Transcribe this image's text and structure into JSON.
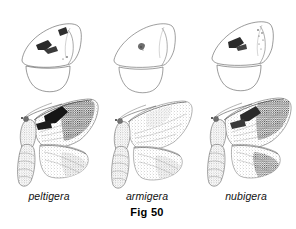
{
  "plate": {
    "figure_number": "Fig 50",
    "background_color": "#ffffff",
    "ink_color": "#1a1a1a",
    "width": 296,
    "height": 229
  },
  "specimens": [
    {
      "id": "peltigera",
      "label": "peltigera",
      "column": 0,
      "upper_diagram": {
        "name": "wing-outline-diagram",
        "description": "outline drawing of forewing and hindwing with dark costal marks",
        "marks": "dark wedge marks along leading edge"
      },
      "lower_figure": {
        "name": "moth-habitus-illustration",
        "description": "stippled moth with body, antennae and spread wings",
        "marks": "bold dark triangular patch on forewing costa"
      }
    },
    {
      "id": "armigera",
      "label": "armigera",
      "column": 1,
      "upper_diagram": {
        "name": "wing-outline-diagram",
        "description": "outline drawing of forewing and hindwing with small central spot",
        "marks": "small discal spot only"
      },
      "lower_figure": {
        "name": "moth-habitus-illustration",
        "description": "stippled moth with body, antennae and spread wings",
        "marks": "faint diffuse stippling, no bold patch"
      }
    },
    {
      "id": "nubigera",
      "label": "nubigera",
      "column": 2,
      "upper_diagram": {
        "name": "wing-outline-diagram",
        "description": "outline drawing of forewing and hindwing with dark costal blotch and apical dots",
        "marks": "dark blotch mid-costa plus small apical dots"
      },
      "lower_figure": {
        "name": "moth-habitus-illustration",
        "description": "stippled moth with body, antennae and spread wings",
        "marks": "dark marginal band and discal shading"
      }
    }
  ]
}
